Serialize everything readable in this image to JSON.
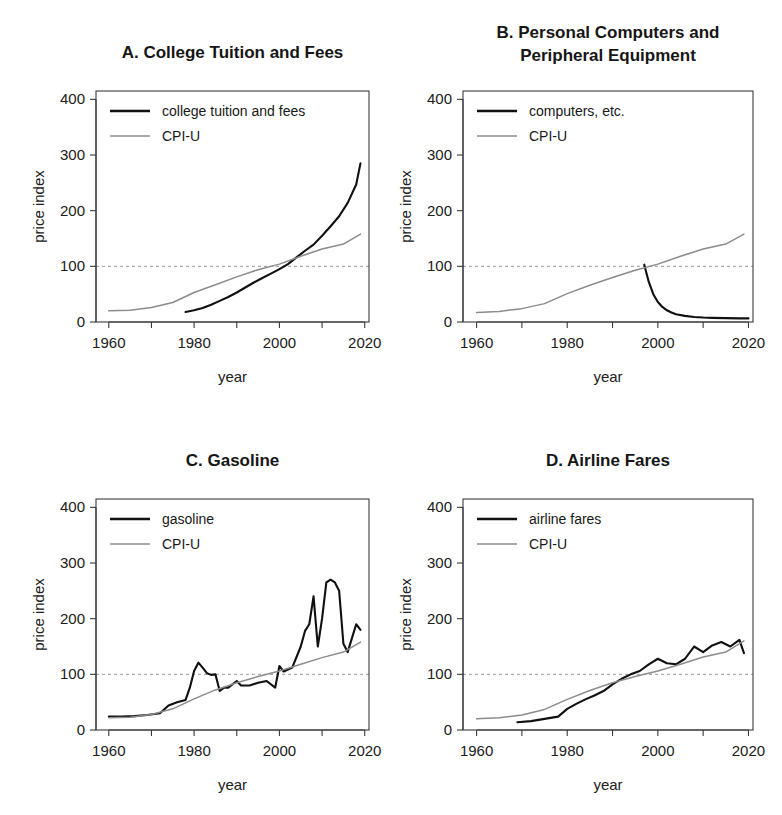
{
  "figure": {
    "axis_titles": {
      "x": "year",
      "y": "price index"
    },
    "x_ticks": [
      "1960",
      "1980",
      "2000",
      "2020"
    ],
    "y_ticks": [
      "0",
      "100",
      "200",
      "300",
      "400"
    ],
    "reference_value": 100,
    "colors": {
      "primary_series": "#101010",
      "cpi_series": "#8c8c8c",
      "reference_line": "#9a9a9a",
      "frame": "#3a3a3a"
    }
  },
  "panels": [
    {
      "id": "A",
      "title": "A. College Tuition and Fees",
      "title_lines": [
        "A. College Tuition and Fees"
      ]
    },
    {
      "id": "B",
      "title": "B. Personal Computers and Peripheral Equipment",
      "title_lines": [
        "B. Personal Computers and",
        "Peripheral Equipment"
      ]
    },
    {
      "id": "C",
      "title": "C. Gasoline",
      "title_lines": [
        "C. Gasoline"
      ]
    },
    {
      "id": "D",
      "title": "D. Airline Fares",
      "title_lines": [
        "D. Airline Fares"
      ]
    }
  ],
  "chart_data": [
    {
      "panel": "A",
      "type": "line",
      "title": "A. College Tuition and Fees",
      "xlabel": "year",
      "ylabel": "price index",
      "xlim": [
        1957,
        2021
      ],
      "ylim": [
        0,
        415
      ],
      "xticks": [
        1960,
        1980,
        2000,
        2020
      ],
      "xminorticks": [
        1970,
        1990,
        2010
      ],
      "yticks": [
        0,
        100,
        200,
        300,
        400
      ],
      "grid": false,
      "reference_line": {
        "y": 100,
        "style": "dashed"
      },
      "legend": {
        "position": "top-left",
        "entries": [
          "college tuition and fees",
          "CPI-U"
        ]
      },
      "series": [
        {
          "name": "college tuition and fees",
          "color": "#101010",
          "x": [
            1978,
            1980,
            1982,
            1984,
            1986,
            1988,
            1990,
            1992,
            1994,
            1996,
            1998,
            2000,
            2002,
            2004,
            2006,
            2008,
            2010,
            2012,
            2014,
            2016,
            2018,
            2019
          ],
          "values": [
            18,
            21,
            25,
            31,
            38,
            45,
            53,
            62,
            71,
            79,
            87,
            95,
            104,
            116,
            128,
            139,
            155,
            172,
            190,
            214,
            247,
            285
          ]
        },
        {
          "name": "CPI-U",
          "color": "#8c8c8c",
          "x": [
            1960,
            1965,
            1970,
            1975,
            1980,
            1985,
            1990,
            1995,
            2000,
            2005,
            2010,
            2015,
            2019
          ],
          "values": [
            20,
            21,
            26,
            35,
            53,
            67,
            81,
            94,
            104,
            118,
            131,
            140,
            158
          ]
        }
      ]
    },
    {
      "panel": "B",
      "type": "line",
      "title": "B. Personal Computers and Peripheral Equipment",
      "xlabel": "year",
      "ylabel": "price index",
      "xlim": [
        1957,
        2021
      ],
      "ylim": [
        0,
        415
      ],
      "xticks": [
        1960,
        1980,
        2000,
        2020
      ],
      "xminorticks": [
        1970,
        1990,
        2010
      ],
      "yticks": [
        0,
        100,
        200,
        300,
        400
      ],
      "grid": false,
      "reference_line": {
        "y": 100,
        "style": "dashed"
      },
      "legend": {
        "position": "top-left",
        "entries": [
          "computers, etc.",
          "CPI-U"
        ]
      },
      "series": [
        {
          "name": "computers, etc.",
          "color": "#101010",
          "x": [
            1997,
            1998,
            1999,
            2000,
            2001,
            2002,
            2003,
            2004,
            2006,
            2008,
            2010,
            2012,
            2015,
            2018,
            2020
          ],
          "values": [
            103,
            72,
            50,
            36,
            27,
            21,
            17,
            14,
            11,
            9,
            8,
            7.5,
            7,
            6.5,
            6.5
          ]
        },
        {
          "name": "CPI-U",
          "color": "#8c8c8c",
          "x": [
            1960,
            1965,
            1970,
            1975,
            1980,
            1985,
            1990,
            1995,
            2000,
            2005,
            2010,
            2015,
            2019
          ],
          "values": [
            17,
            19,
            24,
            33,
            51,
            66,
            80,
            93,
            104,
            118,
            131,
            140,
            158
          ]
        }
      ]
    },
    {
      "panel": "C",
      "type": "line",
      "title": "C. Gasoline",
      "xlabel": "year",
      "ylabel": "price index",
      "xlim": [
        1957,
        2021
      ],
      "ylim": [
        0,
        415
      ],
      "xticks": [
        1960,
        1980,
        2000,
        2020
      ],
      "xminorticks": [
        1970,
        1990,
        2010
      ],
      "yticks": [
        0,
        100,
        200,
        300,
        400
      ],
      "grid": false,
      "reference_line": {
        "y": 100,
        "style": "dashed"
      },
      "legend": {
        "position": "top-left",
        "entries": [
          "gasoline",
          "CPI-U"
        ]
      },
      "series": [
        {
          "name": "gasoline",
          "color": "#101010",
          "x": [
            1960,
            1963,
            1966,
            1969,
            1972,
            1974,
            1976,
            1978,
            1979,
            1980,
            1981,
            1982,
            1983,
            1984,
            1985,
            1986,
            1987,
            1988,
            1990,
            1991,
            1993,
            1995,
            1997,
            1999,
            2000,
            2001,
            2003,
            2005,
            2006,
            2007,
            2008,
            2009,
            2010,
            2011,
            2012,
            2013,
            2014,
            2015,
            2016,
            2017,
            2018,
            2019
          ],
          "values": [
            24,
            24,
            25,
            27,
            30,
            44,
            50,
            54,
            76,
            106,
            121,
            112,
            102,
            99,
            100,
            70,
            76,
            76,
            88,
            80,
            80,
            85,
            88,
            76,
            115,
            105,
            112,
            150,
            178,
            190,
            240,
            150,
            200,
            265,
            270,
            265,
            250,
            155,
            140,
            165,
            190,
            180
          ]
        },
        {
          "name": "CPI-U",
          "color": "#8c8c8c",
          "x": [
            1960,
            1965,
            1970,
            1975,
            1980,
            1985,
            1990,
            1995,
            2000,
            2005,
            2010,
            2015,
            2019
          ],
          "values": [
            22,
            23,
            28,
            38,
            56,
            72,
            85,
            96,
            106,
            118,
            130,
            140,
            158
          ]
        }
      ]
    },
    {
      "panel": "D",
      "type": "line",
      "title": "D. Airline Fares",
      "xlabel": "year",
      "ylabel": "price index",
      "xlim": [
        1957,
        2021
      ],
      "ylim": [
        0,
        415
      ],
      "xticks": [
        1960,
        1980,
        2000,
        2020
      ],
      "xminorticks": [
        1970,
        1990,
        2010
      ],
      "yticks": [
        0,
        100,
        200,
        300,
        400
      ],
      "grid": false,
      "reference_line": {
        "y": 100,
        "style": "dashed"
      },
      "legend": {
        "position": "top-left",
        "entries": [
          "airline fares",
          "CPI-U"
        ]
      },
      "series": [
        {
          "name": "airline fares",
          "color": "#101010",
          "x": [
            1969,
            1972,
            1975,
            1978,
            1980,
            1982,
            1984,
            1986,
            1988,
            1990,
            1992,
            1994,
            1996,
            1998,
            2000,
            2002,
            2004,
            2006,
            2008,
            2010,
            2012,
            2014,
            2016,
            2018,
            2019
          ],
          "values": [
            14,
            16,
            20,
            24,
            38,
            47,
            55,
            62,
            70,
            82,
            92,
            100,
            106,
            118,
            128,
            120,
            118,
            128,
            150,
            140,
            152,
            158,
            150,
            162,
            138
          ]
        },
        {
          "name": "CPI-U",
          "color": "#8c8c8c",
          "x": [
            1960,
            1965,
            1970,
            1975,
            1980,
            1985,
            1990,
            1995,
            2000,
            2005,
            2010,
            2015,
            2019
          ],
          "values": [
            20,
            22,
            27,
            37,
            55,
            71,
            85,
            96,
            106,
            118,
            131,
            140,
            160
          ]
        }
      ]
    }
  ]
}
